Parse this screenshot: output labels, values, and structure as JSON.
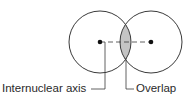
{
  "diagram": {
    "labels": {
      "internuclear_axis": "Internuclear axis",
      "overlap": "Overlap"
    },
    "atoms": [
      {
        "name": "left-nucleus",
        "cx": 100,
        "cy": 42,
        "radius": 31
      },
      {
        "name": "right-nucleus",
        "cx": 151,
        "cy": 42,
        "radius": 31
      }
    ],
    "colors": {
      "stroke": "#3a3a3a",
      "overlap_fill": "#c4c4c4",
      "nucleus": "#111111",
      "background": "#ffffff"
    }
  }
}
